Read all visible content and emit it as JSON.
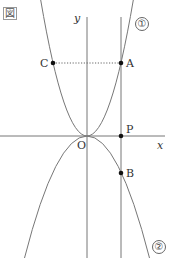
{
  "figure": {
    "label": "図",
    "axes": {
      "x_label": "x",
      "y_label": "y",
      "origin_label": "O"
    },
    "curves": [
      {
        "id": "curve-1",
        "label": "①",
        "type": "parabola",
        "opens": "up",
        "vertex": "O"
      },
      {
        "id": "curve-2",
        "label": "②",
        "type": "parabola",
        "opens": "down",
        "vertex": "O"
      }
    ],
    "points": [
      {
        "name": "A",
        "description": "intersection of vertical line with curve ①"
      },
      {
        "name": "B",
        "description": "intersection of vertical line with curve ②"
      },
      {
        "name": "C",
        "description": "point on curve ① with same y as A"
      },
      {
        "name": "P",
        "description": "intersection of vertical line with x-axis"
      }
    ],
    "segments": [
      {
        "from": "C",
        "to": "A",
        "style": "dotted"
      }
    ]
  }
}
